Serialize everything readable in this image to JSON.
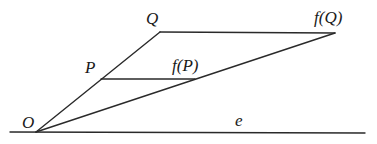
{
  "diagram": {
    "points": {
      "O": {
        "label": "O",
        "x": 36,
        "y": 132
      },
      "P": {
        "label": "P",
        "x": 101,
        "y": 79
      },
      "Q": {
        "label": "Q",
        "x": 160,
        "y": 32
      },
      "fP": {
        "label": "f(P)",
        "x": 195,
        "y": 79
      },
      "fQ": {
        "label": "f(Q)",
        "x": 335,
        "y": 33
      }
    },
    "line_e": {
      "label": "e",
      "x1": 10,
      "y1": 132,
      "x2": 365,
      "y2": 133
    },
    "segments": [
      {
        "from": "O",
        "to": "Q"
      },
      {
        "from": "O",
        "to": "fQ"
      },
      {
        "from": "Q",
        "to": "fQ"
      },
      {
        "from": "P",
        "to": "fP"
      }
    ],
    "colors": {
      "stroke": "#2a2a2a",
      "text": "#1a1a1a",
      "background": "#ffffff"
    }
  }
}
